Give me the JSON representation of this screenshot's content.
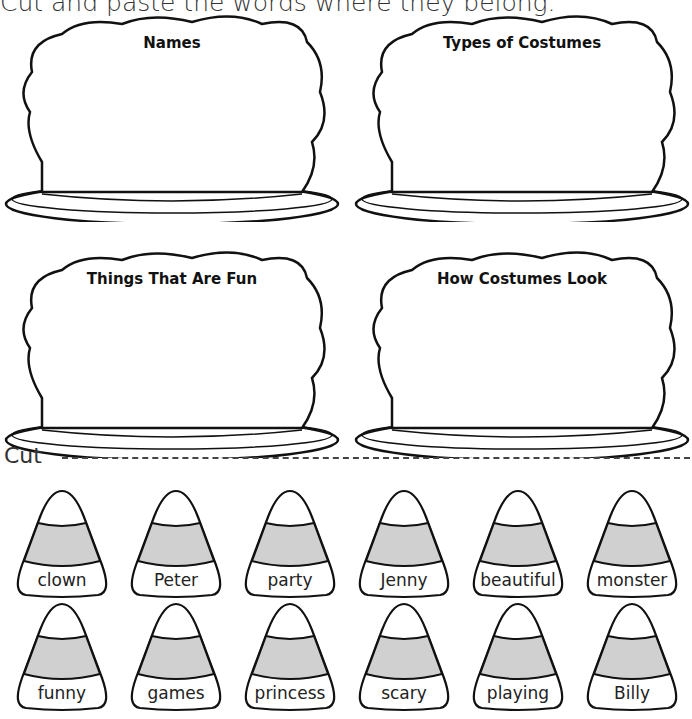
{
  "instructions": "Cut and paste the words where they belong.",
  "cakes": [
    {
      "title": "Names"
    },
    {
      "title": "Types of Costumes"
    },
    {
      "title": "Things That Are Fun"
    },
    {
      "title": "How Costumes Look"
    }
  ],
  "cut_label": "Cut",
  "colors": {
    "candy_band": "#d0d0d0",
    "outline": "#111111"
  },
  "candies": {
    "row1": [
      "clown",
      "Peter",
      "party",
      "Jenny",
      "beautiful",
      "monster"
    ],
    "row2": [
      "funny",
      "games",
      "princess",
      "scary",
      "playing",
      "Billy"
    ]
  }
}
